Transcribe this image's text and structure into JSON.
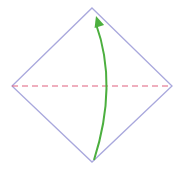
{
  "diagram": {
    "type": "origami-fold-step",
    "paper": {
      "shape": "diamond",
      "vertices": {
        "top": [
          92,
          8
        ],
        "right": [
          172,
          86
        ],
        "bottom": [
          92,
          162
        ],
        "left": [
          12,
          86
        ]
      },
      "edge_color": "#a9a8dd"
    },
    "fold_line": {
      "style": "dashed",
      "type": "valley-fold",
      "from": [
        12,
        86
      ],
      "to": [
        172,
        86
      ],
      "color": "#e0607e"
    },
    "arrow": {
      "meaning": "fold bottom corner up to top",
      "start": [
        94,
        160
      ],
      "control": [
        118,
        85
      ],
      "end": [
        96,
        16
      ],
      "color": "#4caf3f"
    }
  }
}
